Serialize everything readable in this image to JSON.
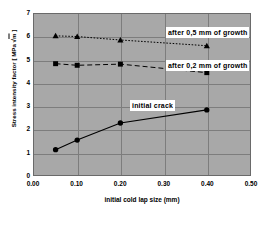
{
  "chart_data": {
    "type": "line",
    "title": "",
    "xlabel": "initial cold lap size (mm)",
    "ylabel": "Stress intensity factor [ MPa √m ]",
    "ylabel_prefix": "Stress intensity factor [ MPa ",
    "ylabel_radical": "√",
    "ylabel_radicand": "m",
    "ylabel_suffix": " ]",
    "xlim": [
      0.0,
      0.5
    ],
    "ylim": [
      0,
      7
    ],
    "xticks": [
      "0.00",
      "0.10",
      "0.20",
      "0.30",
      "0.40",
      "0.50"
    ],
    "xtick_values": [
      0.0,
      0.1,
      0.2,
      0.3,
      0.4,
      0.5
    ],
    "yticks": [
      "0",
      "1",
      "2",
      "3",
      "4",
      "5",
      "6",
      "7"
    ],
    "ytick_values": [
      0,
      1,
      2,
      3,
      4,
      5,
      6,
      7
    ],
    "grid": true,
    "grid_color": "#7d7d7d",
    "plot_background": "#a8a8a8",
    "legend_position": "inline-annotations",
    "x": [
      0.05,
      0.1,
      0.2,
      0.4
    ],
    "series": [
      {
        "name": "after 0,5 mm of growth",
        "values": [
          6.05,
          6.02,
          5.87,
          5.62
        ],
        "marker": "triangle",
        "linestyle": "dotted",
        "color": "#000000"
      },
      {
        "name": "after 0,2 mm of growth",
        "values": [
          4.84,
          4.77,
          4.82,
          4.45
        ],
        "marker": "square",
        "linestyle": "dashed",
        "color": "#000000"
      },
      {
        "name": "initial crack",
        "values": [
          1.1,
          1.52,
          2.26,
          2.83
        ],
        "marker": "circle",
        "linestyle": "solid",
        "color": "#000000"
      }
    ],
    "annotations": [
      {
        "text": "after 0,5 mm of growth",
        "x_px": 166,
        "y_px": 27
      },
      {
        "text": "after 0,2 mm of growth",
        "x_px": 166,
        "y_px": 60
      },
      {
        "text": "initial crack",
        "x_px": 130,
        "y_px": 100
      }
    ]
  }
}
